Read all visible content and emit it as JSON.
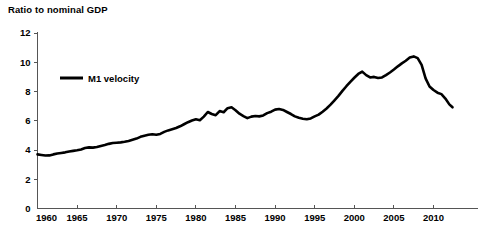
{
  "chart_data": {
    "type": "line",
    "title": "Ratio to nominal GDP",
    "xlabel": "",
    "ylabel": "",
    "xlim": [
      1960,
      2012.5
    ],
    "ylim": [
      0,
      12
    ],
    "grid": false,
    "legend_position": "inside-top-left",
    "y_ticks": [
      0,
      2,
      4,
      6,
      8,
      10,
      12
    ],
    "y_tick_labels": [
      "0",
      "2",
      "4",
      "6",
      "8",
      "10",
      "12"
    ],
    "x_ticks": [
      1960,
      1965,
      1970,
      1975,
      1980,
      1985,
      1990,
      1995,
      2000,
      2005,
      2010
    ],
    "x_tick_labels": [
      "1960",
      "1965",
      "1970",
      "1975",
      "1980",
      "1985",
      "1990",
      "1995",
      "2000",
      "2005",
      "2010"
    ],
    "series": [
      {
        "name": "M1 velocity",
        "color": "#000000",
        "x": [
          1960.0,
          1960.5,
          1961.0,
          1961.5,
          1962.0,
          1962.5,
          1963.0,
          1963.5,
          1964.0,
          1964.5,
          1965.0,
          1965.5,
          1966.0,
          1966.5,
          1967.0,
          1967.5,
          1968.0,
          1968.5,
          1969.0,
          1969.5,
          1970.0,
          1970.5,
          1971.0,
          1971.5,
          1972.0,
          1972.5,
          1973.0,
          1973.5,
          1974.0,
          1974.5,
          1975.0,
          1975.5,
          1976.0,
          1976.5,
          1977.0,
          1977.5,
          1978.0,
          1978.5,
          1979.0,
          1979.5,
          1980.0,
          1980.5,
          1981.0,
          1981.5,
          1982.0,
          1982.5,
          1983.0,
          1983.5,
          1984.0,
          1984.5,
          1985.0,
          1985.5,
          1986.0,
          1986.5,
          1987.0,
          1987.5,
          1988.0,
          1988.5,
          1989.0,
          1989.5,
          1990.0,
          1990.5,
          1991.0,
          1991.5,
          1992.0,
          1992.5,
          1993.0,
          1993.5,
          1994.0,
          1994.5,
          1995.0,
          1995.5,
          1996.0,
          1996.5,
          1997.0,
          1997.5,
          1998.0,
          1998.5,
          1999.0,
          1999.5,
          2000.0,
          2000.5,
          2001.0,
          2001.5,
          2002.0,
          2002.5,
          2003.0,
          2003.5,
          2004.0,
          2004.5,
          2005.0,
          2005.5,
          2006.0,
          2006.5,
          2007.0,
          2007.5,
          2008.0,
          2008.5,
          2009.0,
          2009.5,
          2010.0,
          2010.5,
          2011.0,
          2011.5,
          2012.0,
          2012.4
        ],
        "values": [
          3.7,
          3.66,
          3.62,
          3.63,
          3.7,
          3.76,
          3.8,
          3.84,
          3.9,
          3.94,
          3.98,
          4.04,
          4.14,
          4.18,
          4.16,
          4.2,
          4.28,
          4.34,
          4.42,
          4.48,
          4.5,
          4.52,
          4.56,
          4.62,
          4.7,
          4.78,
          4.9,
          4.98,
          5.04,
          5.08,
          5.04,
          5.1,
          5.24,
          5.34,
          5.42,
          5.5,
          5.62,
          5.76,
          5.9,
          6.02,
          6.1,
          6.04,
          6.28,
          6.6,
          6.46,
          6.38,
          6.66,
          6.58,
          6.86,
          6.92,
          6.72,
          6.48,
          6.32,
          6.18,
          6.28,
          6.32,
          6.3,
          6.36,
          6.52,
          6.62,
          6.76,
          6.8,
          6.74,
          6.6,
          6.46,
          6.3,
          6.2,
          6.14,
          6.1,
          6.16,
          6.3,
          6.42,
          6.62,
          6.84,
          7.1,
          7.4,
          7.7,
          8.04,
          8.36,
          8.66,
          8.94,
          9.2,
          9.36,
          9.12,
          8.96,
          9.0,
          8.92,
          8.96,
          9.12,
          9.3,
          9.5,
          9.72,
          9.92,
          10.1,
          10.32,
          10.4,
          10.28,
          9.82,
          8.9,
          8.34,
          8.1,
          7.92,
          7.82,
          7.52,
          7.12,
          6.92
        ]
      }
    ]
  },
  "legend": {
    "entries": [
      {
        "label": "M1 velocity"
      }
    ]
  }
}
